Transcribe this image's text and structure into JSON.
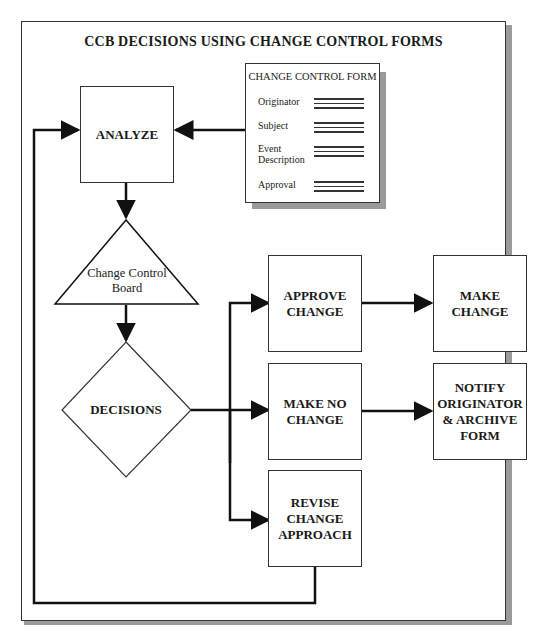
{
  "diagram": {
    "title": "CCB DECISIONS USING CHANGE CONTROL FORMS",
    "form": {
      "title": "CHANGE CONTROL FORM",
      "fields": [
        {
          "label": "Originator"
        },
        {
          "label": "Subject"
        },
        {
          "label": "Event Description"
        },
        {
          "label": "Approval"
        }
      ]
    },
    "nodes": {
      "analyze": "ANALYZE",
      "ccb": "Change Control Board",
      "decisions": "DECISIONS",
      "approve": "APPROVE CHANGE",
      "make_change": "MAKE CHANGE",
      "no_change": "MAKE NO CHANGE",
      "notify": "NOTIFY ORIGINATOR & ARCHIVE FORM",
      "revise": "REVISE CHANGE APPROACH"
    },
    "edges": [
      {
        "from": "form",
        "to": "analyze"
      },
      {
        "from": "analyze",
        "to": "ccb"
      },
      {
        "from": "ccb",
        "to": "decisions"
      },
      {
        "from": "decisions",
        "to": "approve"
      },
      {
        "from": "decisions",
        "to": "no_change"
      },
      {
        "from": "decisions",
        "to": "revise"
      },
      {
        "from": "approve",
        "to": "make_change"
      },
      {
        "from": "no_change",
        "to": "notify"
      },
      {
        "from": "revise",
        "to": "analyze"
      }
    ]
  }
}
